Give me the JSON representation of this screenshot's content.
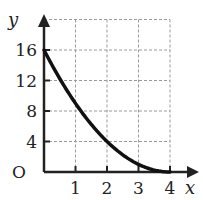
{
  "chart_data": {
    "type": "line",
    "title": "",
    "xlabel": "x",
    "ylabel": "y",
    "origin_label": "O",
    "xlim": [
      0,
      4.8
    ],
    "ylim": [
      0,
      20
    ],
    "grid": true,
    "x_ticks": [
      1,
      2,
      3,
      4
    ],
    "x_tick_labels": [
      "1",
      "2",
      "3",
      "4"
    ],
    "y_ticks": [
      4,
      8,
      12,
      16
    ],
    "y_tick_labels": [
      "4",
      "8",
      "12",
      "16"
    ],
    "series": [
      {
        "name": "curve",
        "x": [
          0,
          0.5,
          1,
          1.5,
          2,
          2.5,
          3,
          3.5,
          4
        ],
        "y": [
          16,
          12.25,
          9,
          6.25,
          4,
          2.25,
          1,
          0.25,
          0
        ]
      }
    ],
    "colors": {
      "axis": "#222222",
      "grid": "#9a9a9a",
      "curve": "#111111"
    }
  }
}
